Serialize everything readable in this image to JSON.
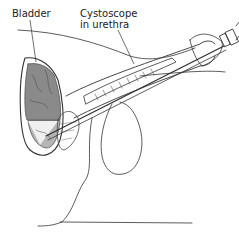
{
  "diagram": {
    "type": "medical-illustration",
    "labels": {
      "bladder": "Bladder",
      "cystoscope_line1": "Cystoscope",
      "cystoscope_line2": "in urethra"
    },
    "colors": {
      "line": "#333333",
      "bladder_fill": "#8a8a8a",
      "bladder_light": "#b5b5b5",
      "background": "#ffffff"
    }
  }
}
